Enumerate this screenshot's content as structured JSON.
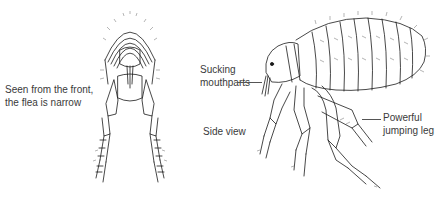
{
  "figure": {
    "front_view": {
      "caption_line1": "Seen from the front,",
      "caption_line2": "the flea is narrow"
    },
    "side_view": {
      "caption": "Side view",
      "labels": {
        "mouthparts_line1": "Sucking",
        "mouthparts_line2": "mouthparts",
        "leg_line1": "Powerful",
        "leg_line2": "jumping leg"
      }
    },
    "colors": {
      "background": "#ffffff",
      "ink": "#1a1a1a",
      "text": "#3a3a3a"
    }
  }
}
